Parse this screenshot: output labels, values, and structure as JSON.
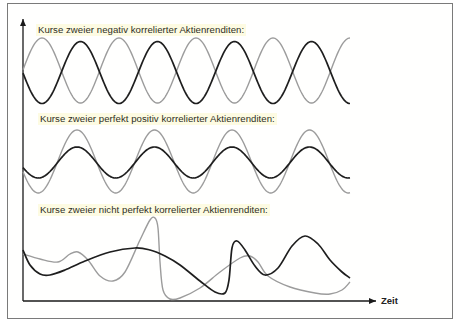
{
  "figure": {
    "colors": {
      "frame": "#7a7a7a",
      "axis": "#1a1a1a",
      "series_dark": "#1e1e1e",
      "series_light": "#9c9c9c",
      "label_background": "#fdfbe2"
    },
    "axes": {
      "x_label": "Zeit",
      "y_label": ""
    },
    "panels": [
      {
        "id": "negative",
        "title": "Kurse zweier negativ korrelierter Aktienrenditen:"
      },
      {
        "id": "positive",
        "title": "Kurse zweier perfekt positiv korrelierter Aktienrenditen:"
      },
      {
        "id": "imperfect",
        "title": "Kurse zweier nicht perfekt korrelierter Aktienrenditen:"
      }
    ]
  },
  "chart_data": [
    {
      "type": "line",
      "title": "Kurse zweier negativ korrelierter Aktienrenditen:",
      "xlabel": "Zeit",
      "ylabel": "",
      "description": "Two sine waves of equal period in exact opposite phase",
      "x_range": [
        23,
        350
      ],
      "series": [
        {
          "name": "Aktie A (grau)",
          "color": "#9c9c9c",
          "shape": "sine",
          "midline": 70.5,
          "amplitude": 32.5,
          "period": 77,
          "first_peak_x": 42
        },
        {
          "name": "Aktie B (schwarz)",
          "color": "#1e1e1e",
          "shape": "sine",
          "midline": 72.5,
          "amplitude": 31,
          "period": 77,
          "first_peak_x": 80.5
        }
      ]
    },
    {
      "type": "line",
      "title": "Kurse zweier perfekt positiv korrelierter Aktienrenditen:",
      "xlabel": "Zeit",
      "ylabel": "",
      "description": "Two sine waves in phase with different amplitudes",
      "x_range": [
        23,
        350
      ],
      "series": [
        {
          "name": "Aktie A (grau)",
          "color": "#9c9c9c",
          "shape": "sine",
          "midline": 161.5,
          "amplitude": 31.5,
          "period": 77.5,
          "first_peak_x": 77
        },
        {
          "name": "Aktie B (schwarz)",
          "color": "#1e1e1e",
          "shape": "sine",
          "midline": 162.5,
          "amplitude": 15.5,
          "period": 77.5,
          "first_peak_x": 77
        }
      ]
    },
    {
      "type": "line",
      "title": "Kurse zweier nicht perfekt korrelierter Aktienrenditen:",
      "xlabel": "Zeit",
      "ylabel": "",
      "description": "Two irregular curves with partial co-movement",
      "series": [
        {
          "name": "Aktie A (grau)",
          "color": "#9c9c9c",
          "points": [
            [
              23,
              254
            ],
            [
              40,
              259
            ],
            [
              58,
              262
            ],
            [
              70,
              254
            ],
            [
              78,
              252
            ],
            [
              88,
              260
            ],
            [
              100,
              276
            ],
            [
              113,
              281
            ],
            [
              125,
              272
            ],
            [
              140,
              240
            ],
            [
              150,
              220
            ],
            [
              155,
              218
            ],
            [
              158,
              228
            ],
            [
              160,
              262
            ],
            [
              163,
              290
            ],
            [
              170,
              299
            ],
            [
              180,
              298
            ],
            [
              200,
              288
            ],
            [
              220,
              272
            ],
            [
              240,
              258
            ],
            [
              250,
              256
            ],
            [
              258,
              262
            ],
            [
              268,
              276
            ],
            [
              290,
              287
            ],
            [
              315,
              293
            ],
            [
              330,
              294
            ],
            [
              342,
              290
            ],
            [
              350,
              282
            ]
          ]
        },
        {
          "name": "Aktie B (schwarz)",
          "color": "#1e1e1e",
          "points": [
            [
              23,
              250
            ],
            [
              30,
              265
            ],
            [
              40,
              274
            ],
            [
              50,
              275
            ],
            [
              65,
              270
            ],
            [
              85,
              261
            ],
            [
              110,
              252
            ],
            [
              135,
              248
            ],
            [
              150,
              250
            ],
            [
              165,
              256
            ],
            [
              180,
              265
            ],
            [
              200,
              281
            ],
            [
              215,
              292
            ],
            [
              225,
              293
            ],
            [
              229,
              280
            ],
            [
              232,
              248
            ],
            [
              237,
              241
            ],
            [
              245,
              250
            ],
            [
              255,
              266
            ],
            [
              265,
              275
            ],
            [
              278,
              268
            ],
            [
              292,
              246
            ],
            [
              305,
              236
            ],
            [
              318,
              244
            ],
            [
              330,
              260
            ],
            [
              342,
              272
            ],
            [
              350,
              278
            ]
          ]
        }
      ]
    }
  ]
}
